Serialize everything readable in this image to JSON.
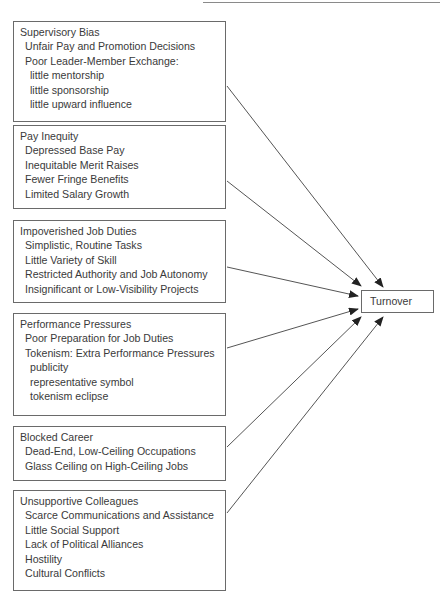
{
  "diagram": {
    "type": "causal-model",
    "outcome": {
      "label": "Turnover"
    },
    "factors": [
      {
        "title": "Supervisory Bias",
        "items": [
          {
            "text": "Unfair Pay and Promotion Decisions",
            "level": 1
          },
          {
            "text": "Poor Leader-Member Exchange:",
            "level": 1
          },
          {
            "text": "little mentorship",
            "level": 2
          },
          {
            "text": "little sponsorship",
            "level": 2
          },
          {
            "text": "little upward influence",
            "level": 2
          }
        ]
      },
      {
        "title": "Pay Inequity",
        "items": [
          {
            "text": "Depressed Base Pay",
            "level": 1
          },
          {
            "text": "Inequitable Merit Raises",
            "level": 1
          },
          {
            "text": "Fewer Fringe Benefits",
            "level": 1
          },
          {
            "text": "Limited Salary Growth",
            "level": 1
          }
        ]
      },
      {
        "title": "Impoverished Job Duties",
        "items": [
          {
            "text": "Simplistic, Routine Tasks",
            "level": 1
          },
          {
            "text": "Little Variety of Skill",
            "level": 1
          },
          {
            "text": "Restricted Authority and Job Autonomy",
            "level": 1
          },
          {
            "text": "Insignificant or Low-Visibility Projects",
            "level": 1
          }
        ]
      },
      {
        "title": "Performance Pressures",
        "items": [
          {
            "text": "Poor Preparation for Job Duties",
            "level": 1
          },
          {
            "text": "Tokenism: Extra Performance Pressures",
            "level": 1
          },
          {
            "text": "publicity",
            "level": 2
          },
          {
            "text": "representative symbol",
            "level": 2
          },
          {
            "text": "tokenism eclipse",
            "level": 2
          }
        ]
      },
      {
        "title": "Blocked Career",
        "items": [
          {
            "text": "Dead-End, Low-Ceiling Occupations",
            "level": 1
          },
          {
            "text": "Glass Ceiling on High-Ceiling Jobs",
            "level": 1
          }
        ]
      },
      {
        "title": "Unsupportive Colleagues",
        "items": [
          {
            "text": "Scarce Communications and Assistance",
            "level": 1
          },
          {
            "text": "Little Social Support",
            "level": 1
          },
          {
            "text": "Lack of Political Alliances",
            "level": 1
          },
          {
            "text": "Hostility",
            "level": 1
          },
          {
            "text": "Cultural Conflicts",
            "level": 1
          }
        ]
      }
    ],
    "edges": [
      {
        "from": "Supervisory Bias",
        "to": "Turnover"
      },
      {
        "from": "Pay Inequity",
        "to": "Turnover"
      },
      {
        "from": "Impoverished Job Duties",
        "to": "Turnover"
      },
      {
        "from": "Performance Pressures",
        "to": "Turnover"
      },
      {
        "from": "Blocked Career",
        "to": "Turnover"
      },
      {
        "from": "Unsupportive Colleagues",
        "to": "Turnover"
      }
    ],
    "colors": {
      "line": "#555555",
      "border": "#6a6a6a",
      "text": "#3a3a3a",
      "background": "#ffffff"
    }
  }
}
